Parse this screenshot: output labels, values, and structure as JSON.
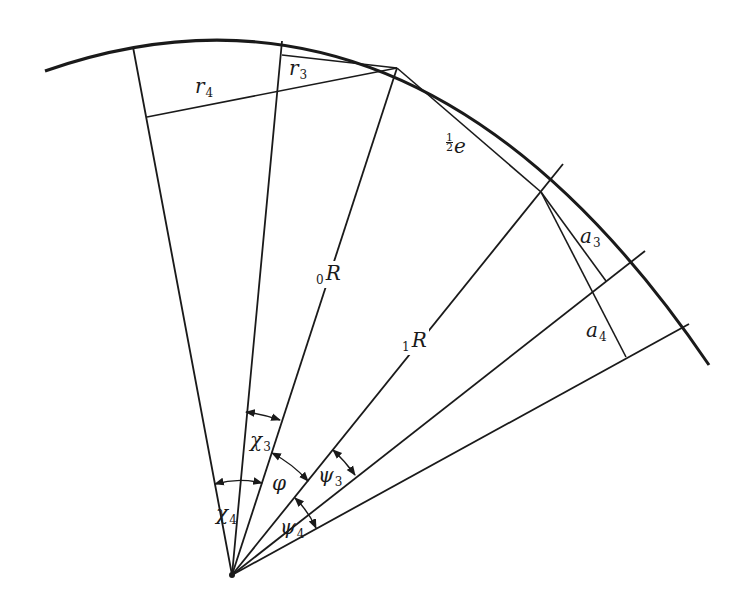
{
  "diagram": {
    "title": "",
    "stroke_color": "#1a1a1a",
    "background": "#ffffff",
    "apex": [
      232,
      575
    ],
    "outer_arc": {
      "start": [
        45,
        71
      ],
      "control": [
        420,
        -60
      ],
      "end": [
        709,
        365
      ]
    },
    "radials": [
      {
        "name": "radial-chi4",
        "from": [
          232,
          575
        ],
        "to": [
          133,
          47
        ]
      },
      {
        "name": "radial-chi3",
        "from": [
          232,
          575
        ],
        "to": [
          282,
          41
        ]
      },
      {
        "name": "radial-0R",
        "from": [
          232,
          575
        ],
        "to": [
          397,
          68
        ]
      },
      {
        "name": "radial-1R",
        "from": [
          232,
          575
        ],
        "to": [
          563,
          164
        ]
      },
      {
        "name": "radial-psi3",
        "from": [
          232,
          575
        ],
        "to": [
          645,
          251
        ]
      },
      {
        "name": "radial-psi4",
        "from": [
          232,
          575
        ],
        "to": [
          689,
          324
        ]
      }
    ],
    "segments": [
      {
        "name": "chord-r3",
        "from": [
          282,
          55
        ],
        "to": [
          397,
          68
        ]
      },
      {
        "name": "chord-r4",
        "from": [
          147,
          117
        ],
        "to": [
          397,
          68
        ]
      },
      {
        "name": "chord-half-e",
        "from": [
          397,
          68
        ],
        "to": [
          541,
          192
        ]
      },
      {
        "name": "segment-a3",
        "from": [
          541,
          192
        ],
        "to": [
          606,
          281
        ]
      },
      {
        "name": "segment-a4",
        "from": [
          541,
          192
        ],
        "to": [
          626,
          357
        ]
      }
    ],
    "labels": {
      "r4": {
        "main": "r",
        "sub": "4",
        "pos": [
          195,
          76
        ]
      },
      "r3": {
        "main": "r",
        "sub": "3",
        "pos": [
          289,
          58
        ]
      },
      "half_e": {
        "num": "1",
        "den": "2",
        "main": "e",
        "pos": [
          446,
          133
        ]
      },
      "a3": {
        "main": "a",
        "sub": "3",
        "pos": [
          580,
          226
        ]
      },
      "a4": {
        "main": "a",
        "sub": "4",
        "pos": [
          586,
          320
        ]
      },
      "R0": {
        "pre": "0",
        "main": "R",
        "pos": [
          314,
          261
        ]
      },
      "R1": {
        "pre": "1",
        "main": "R",
        "pos": [
          400,
          328
        ]
      },
      "chi3": {
        "main": "χ",
        "sub": "3",
        "pos": [
          250,
          430
        ]
      },
      "chi4": {
        "main": "χ",
        "sub": "4",
        "pos": [
          216,
          503
        ]
      },
      "phi": {
        "main": "φ",
        "pos": [
          272,
          473
        ]
      },
      "psi3": {
        "main": "ψ",
        "sub": "3",
        "pos": [
          318,
          465
        ]
      },
      "psi4": {
        "main": "ψ",
        "sub": "4",
        "pos": [
          280,
          517
        ]
      }
    },
    "angle_markers": [
      {
        "name": "angle-chi3",
        "from": [
          246,
          412
        ],
        "to": [
          280,
          420
        ]
      },
      {
        "name": "angle-chi4",
        "from": [
          215,
          484
        ],
        "to": [
          262,
          483
        ]
      },
      {
        "name": "angle-phi",
        "from": [
          272,
          453
        ],
        "to": [
          308,
          481
        ]
      },
      {
        "name": "angle-psi3",
        "from": [
          333,
          450
        ],
        "to": [
          355,
          475
        ]
      },
      {
        "name": "angle-psi4",
        "from": [
          295,
          498
        ],
        "to": [
          316,
          528
        ]
      }
    ]
  }
}
